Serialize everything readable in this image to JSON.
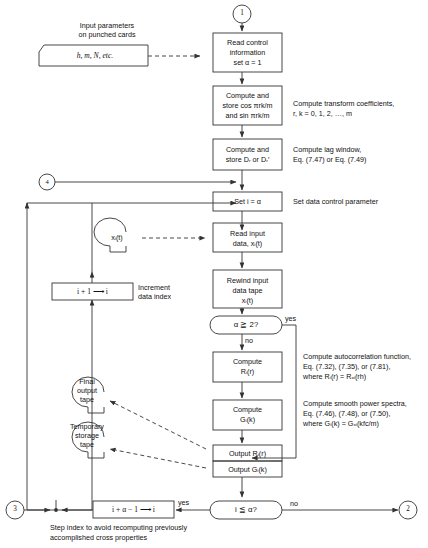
{
  "figure": {
    "type": "flowchart"
  },
  "connectors": {
    "start_1": "1",
    "entry_4": "4",
    "exit_3": "3",
    "exit_2": "2"
  },
  "input_note": {
    "line1": "Input parameters",
    "line2": "on punched cards",
    "card_text": "h, m, N, etc."
  },
  "boxes": {
    "read_control": {
      "line1": "Read control",
      "line2": "information",
      "line3": "set α = 1"
    },
    "compute_cos": {
      "line1": "Compute and",
      "line2": "store cos πrk/m",
      "line3": "and sin πrk/m"
    },
    "compute_d": {
      "line1": "Compute and",
      "line2": "store Dᵣ or Dᵣ′"
    },
    "set_i": {
      "line1": "Set i = α"
    },
    "read_input": {
      "line1": "Read input",
      "line2": "data, xᵢ(t)"
    },
    "rewind": {
      "line1": "Rewind input",
      "line2": "data tape",
      "line3": "xᵢ(t)"
    },
    "compute_r": {
      "line1": "Compute",
      "line2": "Rᵢ(r)"
    },
    "compute_g": {
      "line1": "Compute",
      "line2": "Gᵢ(k)"
    },
    "output_r": {
      "line1": "Output Rᵢ(r)"
    },
    "output_g": {
      "line1": "Output Gᵢ(k)"
    },
    "increment": {
      "line1": "i + 1 ⟶ i"
    },
    "step_index": {
      "line1": "i + α − 1 ⟶ i"
    }
  },
  "decisions": {
    "alpha_ge_2": {
      "text": "α ≧ 2?",
      "yes_label": "yes",
      "no_label": "no"
    },
    "i_le_alpha": {
      "text": "i ≦ α?",
      "yes_label": "yes",
      "no_label": "no"
    }
  },
  "tapes": {
    "input_tape": {
      "label": "xᵢ(t)"
    },
    "final_output": {
      "line1": "Final",
      "line2": "output",
      "line3": "tape"
    },
    "temporary_storage": {
      "line1": "Temporary",
      "line2": "storage",
      "line3": "tape"
    }
  },
  "annotations": {
    "transform": {
      "line1": "Compute transform coefficients,",
      "line2": "r, k = 0, 1, 2, …, m"
    },
    "lag_window": {
      "line1": "Compute lag window,",
      "line2": "Eq. (7.47) or Eq. (7.49)"
    },
    "data_control": {
      "line1": "Set data control parameter"
    },
    "increment_note": {
      "line1": "Increment",
      "line2": "data index"
    },
    "autocorrelation": {
      "line1": "Compute autocorrelation function,",
      "line2": "Eq. (7.32), (7.35), or (7.81),",
      "line3": "where Rᵢ(r) = Rₓᵢ(rh)"
    },
    "spectra": {
      "line1": "Compute smooth power spectra,",
      "line2": "Eq. (7.46), (7.48), or (7.50),",
      "line3": "where Gᵢ(k) = Gₓᵢ(kfᴄ/m)"
    },
    "step_note": {
      "line1": "Step index to avoid recomputing previously",
      "line2": "accomplished cross properties"
    }
  },
  "colors": {
    "stroke": "#333333",
    "text": "#111111",
    "background": "#ffffff"
  }
}
